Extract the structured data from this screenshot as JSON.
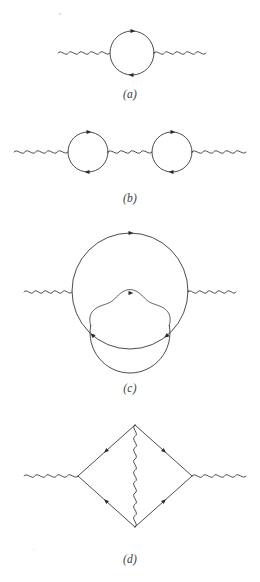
{
  "figure": {
    "kind": "feynman-diagram-set",
    "background_color": "#ffffff",
    "ink_color": "#2b2b33",
    "panels": [
      {
        "id": "a",
        "label": "(a)",
        "label_x": 100,
        "label_y": 88,
        "description": "one-loop photon self-energy: wavy photon line into a fermion loop and out",
        "elements": {
          "photon_in": {
            "x1": 58,
            "y1": 53,
            "x2": 110,
            "y2": 53
          },
          "photon_out": {
            "x1": 154,
            "y1": 53,
            "x2": 206,
            "y2": 53
          },
          "loop": {
            "cx": 132,
            "cy": 53,
            "r": 22
          },
          "arrows": [
            {
              "angle_deg": 270,
              "dir": "cw"
            },
            {
              "angle_deg": 90,
              "dir": "cw"
            }
          ]
        }
      },
      {
        "id": "b",
        "label": "(b)",
        "label_x": 100,
        "label_y": 192,
        "description": "two-loop chain: photon, fermion loop, photon, fermion loop, photon",
        "elements": {
          "photon_in": {
            "x1": 14,
            "y1": 152,
            "x2": 68,
            "y2": 152
          },
          "loop_left": {
            "cx": 88,
            "cy": 152,
            "r": 20
          },
          "photon_mid": {
            "x1": 108,
            "y1": 152,
            "x2": 152,
            "y2": 152
          },
          "loop_right": {
            "cx": 172,
            "cy": 152,
            "r": 20
          },
          "photon_out": {
            "x1": 192,
            "y1": 152,
            "x2": 246,
            "y2": 152
          }
        }
      },
      {
        "id": "c",
        "label": "(c)",
        "label_x": 100,
        "label_y": 382,
        "description": "two-loop self-energy: large fermion loop with internal photon correction on the lower arc",
        "elements": {
          "photon_in": {
            "x1": 24,
            "y1": 292,
            "x2": 72,
            "y2": 292
          },
          "photon_out": {
            "x1": 188,
            "y1": 292,
            "x2": 236,
            "y2": 292
          },
          "big_loop": {
            "cx": 130,
            "cy": 291,
            "r": 58
          },
          "inner_fermion_arc": {
            "cx": 130,
            "cy": 333,
            "r": 40
          },
          "inner_photon_arc": {
            "cx": 130,
            "cy": 333,
            "r": 40
          }
        }
      },
      {
        "id": "d",
        "label": "(d)",
        "label_x": 100,
        "label_y": 553,
        "description": "vertex-corrected box: rhombic fermion loop with vertical internal photon line",
        "elements": {
          "photon_in": {
            "x1": 24,
            "y1": 476,
            "x2": 78,
            "y2": 476
          },
          "photon_out": {
            "x1": 192,
            "y1": 476,
            "x2": 246,
            "y2": 476
          },
          "vertex_top": {
            "x": 135,
            "y": 425
          },
          "vertex_bottom": {
            "x": 135,
            "y": 527
          },
          "vertex_left": {
            "x": 78,
            "y": 476
          },
          "vertex_right": {
            "x": 192,
            "y": 476
          },
          "internal_photon": {
            "x1": 135,
            "y1": 425,
            "x2": 135,
            "y2": 527
          }
        }
      }
    ]
  }
}
